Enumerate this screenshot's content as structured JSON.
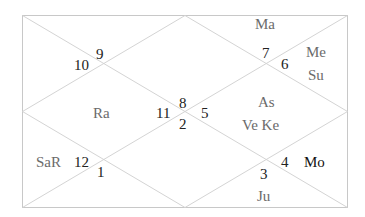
{
  "chart_type": "North Indian birth chart",
  "colors": {
    "line": "#d4d4d4",
    "border": "#c8c8c8",
    "house_number": "#222222",
    "planet": "#6b6b6b",
    "planet_emphasis": "#111111"
  },
  "houses": [
    {
      "position": "top-center",
      "sign": "7",
      "planets": "Ma"
    },
    {
      "position": "top-right",
      "sign": "6",
      "planets": [
        "Me",
        "Su"
      ]
    },
    {
      "position": "top-left",
      "sign": "9",
      "planets": ""
    },
    {
      "position": "left-upper",
      "sign": "10",
      "planets": ""
    },
    {
      "position": "center-left",
      "sign": "11",
      "planets": "Ra"
    },
    {
      "position": "center-top",
      "sign": "8",
      "planets": ""
    },
    {
      "position": "center-bottom",
      "sign": "2",
      "planets": ""
    },
    {
      "position": "center-right",
      "sign": "5",
      "planets": [
        "As",
        "Ve Ke"
      ]
    },
    {
      "position": "left-lower",
      "sign": "12",
      "planets": "SaR"
    },
    {
      "position": "bottom-left",
      "sign": "1",
      "planets": ""
    },
    {
      "position": "right-lower",
      "sign": "4",
      "planets": "Mo"
    },
    {
      "position": "bottom-center",
      "sign": "3",
      "planets": "Ju"
    }
  ],
  "labels": {
    "n9": "9",
    "n10": "10",
    "n7": "7",
    "n6": "6",
    "n8": "8",
    "n11": "11",
    "n2": "2",
    "n5": "5",
    "n12": "12",
    "n1": "1",
    "n4": "4",
    "n3": "3",
    "ma": "Ma",
    "me": "Me",
    "su": "Su",
    "ra": "Ra",
    "as": "As",
    "veke": "Ve Ke",
    "sar": "SaR",
    "mo": "Mo",
    "ju": "Ju"
  }
}
